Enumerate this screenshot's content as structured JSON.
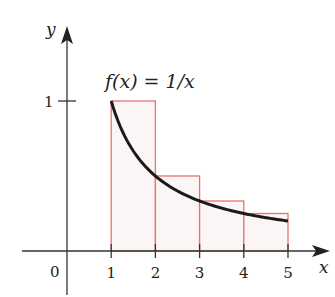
{
  "chart_data": {
    "type": "bar",
    "title": "f(x) = 1/x",
    "xlabel": "x",
    "ylabel": "y",
    "origin_label": "0",
    "x_ticks": [
      "1",
      "2",
      "3",
      "4",
      "5"
    ],
    "y_ticks": [
      "1"
    ],
    "bars": [
      {
        "x0": 1,
        "x1": 2,
        "height": 1.0
      },
      {
        "x0": 2,
        "x1": 3,
        "height": 0.5
      },
      {
        "x0": 3,
        "x1": 4,
        "height": 0.3333
      },
      {
        "x0": 4,
        "x1": 5,
        "height": 0.25
      }
    ],
    "curve": {
      "name": "f(x) = 1/x",
      "x_range": [
        1,
        5
      ]
    },
    "xlim": [
      -1,
      5.8
    ],
    "ylim": [
      -0.3,
      1.5
    ],
    "colors": {
      "bars_stroke": "#e8736b",
      "bars_fill": "#fbf5f5",
      "curve": "#1a1a1a",
      "axes": "#333333"
    }
  }
}
